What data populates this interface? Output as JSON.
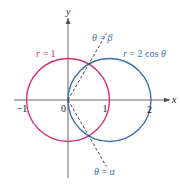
{
  "figure": {
    "axes": {
      "x_label": "x",
      "y_label": "y",
      "x_ticks": [
        {
          "value": -1,
          "label": "−1"
        },
        {
          "value": 0,
          "label": "0"
        },
        {
          "value": 1,
          "label": "1"
        },
        {
          "value": 2,
          "label": "2"
        }
      ]
    },
    "curves": [
      {
        "name": "r = 1",
        "label_r": "r",
        "label_rest": " = 1",
        "type": "circle",
        "center": [
          0,
          0
        ],
        "radius": 1,
        "color": "#d6336c"
      },
      {
        "name": "r = 2 cos θ",
        "label_r": "r",
        "label_rest": " = 2 cos ",
        "label_theta": "θ",
        "type": "circle",
        "center": [
          1,
          0
        ],
        "radius": 1,
        "color": "#3a6fb0"
      }
    ],
    "rays": [
      {
        "name": "θ = β",
        "theta_sym": "θ",
        "eq": " = ",
        "angle_sym": "β",
        "angle_deg": 60,
        "color": "#3a6fb0"
      },
      {
        "name": "θ = α",
        "theta_sym": "θ",
        "eq": " = ",
        "angle_sym": "α",
        "angle_deg": -60,
        "color": "#3a6fb0"
      }
    ],
    "shaded_region": {
      "description": "inside r = 2 cos θ, outside r = 1",
      "color": "#f6d9ae"
    }
  }
}
